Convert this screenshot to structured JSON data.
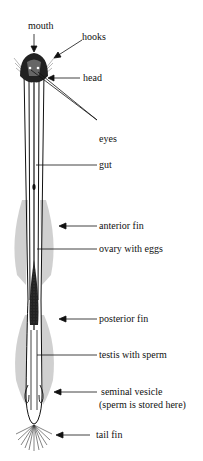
{
  "diagram": {
    "labels": {
      "mouth": "mouth",
      "hooks": "hooks",
      "head": "head",
      "eyes": "eyes",
      "gut": "gut",
      "anterior_fin": "anterior fin",
      "ovary": "ovary with eggs",
      "posterior_fin": "posterior fin",
      "testis": "testis with sperm",
      "seminal_vesicle": "seminal vesicle",
      "seminal_vesicle_note": "(sperm is stored here)",
      "tail_fin": "tail fin"
    },
    "colors": {
      "ink": "#111111",
      "background": "#ffffff",
      "hatch": "#777777"
    }
  }
}
